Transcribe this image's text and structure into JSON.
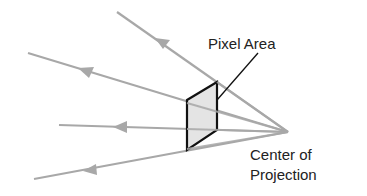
{
  "diagram": {
    "type": "perspective-projection",
    "labels": {
      "pixel_area": "Pixel Area",
      "center_line1": "Center of",
      "center_line2": "Projection"
    },
    "colors": {
      "ray": "#a8a8a8",
      "outline": "#111111",
      "pixel_fill": "#e4e4e4",
      "text": "#222222"
    },
    "center_of_projection": [
      288,
      132
    ],
    "rays": [
      {
        "from": [
          288,
          132
        ],
        "to": [
          117,
          12
        ]
      },
      {
        "from": [
          288,
          132
        ],
        "to": [
          28,
          53
        ]
      },
      {
        "from": [
          288,
          132
        ],
        "to": [
          59,
          125
        ]
      },
      {
        "from": [
          288,
          132
        ],
        "to": [
          34,
          179
        ]
      }
    ],
    "pixel_area_polygon": [
      [
        187,
        100
      ],
      [
        217,
        82
      ],
      [
        217,
        130
      ],
      [
        187,
        150
      ]
    ]
  }
}
